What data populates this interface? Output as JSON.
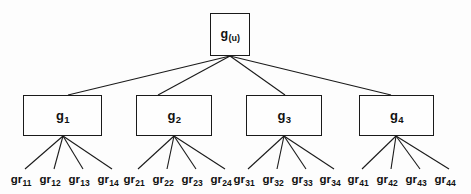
{
  "figure": {
    "type": "hierarchical-tree-diagram",
    "background_color": "#fdfdfd",
    "line_color": "#1a1a1a",
    "text_color": "#111111"
  },
  "root": {
    "base": "g",
    "subscript": "(u)",
    "box": {
      "x": 210,
      "y": 13,
      "width": 40,
      "height": 43
    },
    "fan_origin": {
      "x": 230,
      "y": 56
    }
  },
  "groups": [
    {
      "base": "g",
      "subscript": "1",
      "box": {
        "x": 23,
        "y": 95,
        "width": 79,
        "height": 41
      },
      "parent_attach": {
        "x": 68,
        "y": 95
      },
      "fan_origin": {
        "x": 63,
        "y": 136
      },
      "leaves": [
        {
          "base": "gr",
          "subscript": "11",
          "x": 21,
          "y": 174
        },
        {
          "base": "gr",
          "subscript": "12",
          "x": 50,
          "y": 174
        },
        {
          "base": "gr",
          "subscript": "13",
          "x": 79,
          "y": 174
        },
        {
          "base": "gr",
          "subscript": "14",
          "x": 108,
          "y": 174
        }
      ]
    },
    {
      "base": "g",
      "subscript": "2",
      "box": {
        "x": 136,
        "y": 95,
        "width": 76,
        "height": 41
      },
      "parent_attach": {
        "x": 158,
        "y": 95
      },
      "fan_origin": {
        "x": 174,
        "y": 136
      },
      "leaves": [
        {
          "base": "gr",
          "subscript": "21",
          "x": 134,
          "y": 174
        },
        {
          "base": "gr",
          "subscript": "22",
          "x": 163,
          "y": 174
        },
        {
          "base": "gr",
          "subscript": "23",
          "x": 192,
          "y": 174
        },
        {
          "base": "gr",
          "subscript": "24",
          "x": 221,
          "y": 174
        }
      ]
    },
    {
      "base": "g",
      "subscript": "3",
      "box": {
        "x": 246,
        "y": 95,
        "width": 76,
        "height": 41
      },
      "parent_attach": {
        "x": 285,
        "y": 95
      },
      "fan_origin": {
        "x": 284,
        "y": 136
      },
      "leaves": [
        {
          "base": "gr",
          "subscript": "31",
          "x": 244,
          "y": 174
        },
        {
          "base": "gr",
          "subscript": "32",
          "x": 273,
          "y": 174
        },
        {
          "base": "gr",
          "subscript": "33",
          "x": 302,
          "y": 174
        },
        {
          "base": "gr",
          "subscript": "34",
          "x": 330,
          "y": 174
        }
      ]
    },
    {
      "base": "g",
      "subscript": "4",
      "box": {
        "x": 359,
        "y": 95,
        "width": 75,
        "height": 41
      },
      "parent_attach": {
        "x": 391,
        "y": 95
      },
      "fan_origin": {
        "x": 396,
        "y": 136
      },
      "leaves": [
        {
          "base": "gr",
          "subscript": "41",
          "x": 358,
          "y": 174
        },
        {
          "base": "gr",
          "subscript": "42",
          "x": 387,
          "y": 174
        },
        {
          "base": "gr",
          "subscript": "43",
          "x": 416,
          "y": 174
        },
        {
          "base": "gr",
          "subscript": "44",
          "x": 445,
          "y": 174
        }
      ]
    }
  ]
}
